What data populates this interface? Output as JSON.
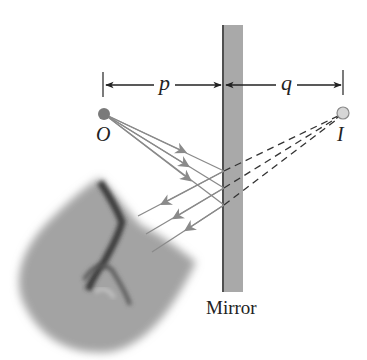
{
  "diagram": {
    "type": "plane-mirror-image-formation",
    "labels": {
      "object_distance": "p",
      "image_distance": "q",
      "object": "O",
      "image": "I",
      "mirror": "Mirror"
    },
    "elements": {
      "object_point": {
        "x": 104,
        "y": 114,
        "fill": "#7a7a7a"
      },
      "image_point": {
        "x": 343,
        "y": 113,
        "fill": "#d6d6d6"
      },
      "mirror": {
        "x": 222,
        "y": 25,
        "width": 21,
        "height": 267,
        "fill": "#a9a9a9",
        "edge": "#333333"
      },
      "reflection_points": [
        {
          "x": 224,
          "y": 171
        },
        {
          "x": 224,
          "y": 188
        },
        {
          "x": 224,
          "y": 205
        }
      ],
      "ray_color": "#8a8a8a",
      "virtual_ray_style": "dashed"
    }
  }
}
